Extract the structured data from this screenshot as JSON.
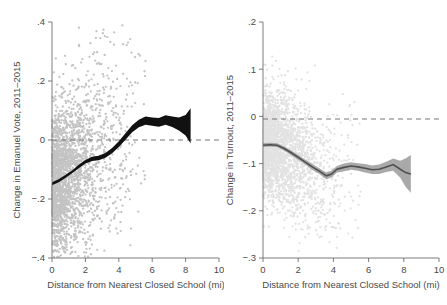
{
  "figure": {
    "width": 447,
    "height": 305,
    "background": "#ffffff"
  },
  "chart_data": [
    {
      "id": "left",
      "type": "scatter",
      "title": "",
      "xlabel": "Distance from Nearest Closed School (mi)",
      "ylabel": "Change in Emanuel Vote, 2011–2015",
      "xlim": [
        0,
        10
      ],
      "ylim": [
        -0.4,
        0.4
      ],
      "xticks": [
        0,
        2,
        4,
        6,
        8,
        10
      ],
      "xticklabels": [
        "0",
        "2",
        "4",
        "6",
        "8",
        "10"
      ],
      "yticks": [
        0.4,
        0.2,
        0,
        -0.2,
        -0.4
      ],
      "yticklabels": [
        ".4",
        ".2",
        "0",
        "-.2",
        "-.4"
      ],
      "grid": false,
      "legend": "none",
      "annotations": [
        {
          "kind": "hline",
          "y": 0,
          "style": "dashed",
          "color": "#777777"
        }
      ],
      "series": [
        {
          "name": "precinct observations",
          "type": "scatter",
          "color": "#c3c3c3",
          "marker": "circle",
          "n_points": 2400,
          "x_range": [
            0,
            6.6
          ],
          "y_range": [
            -0.4,
            0.4
          ],
          "density_note": "dense cloud concentrated between 0 and 2.5 mi, thinning outward"
        },
        {
          "name": "local polynomial fit with 95% CI",
          "type": "line-band",
          "color": "#111111",
          "x": [
            0.0,
            0.4,
            0.8,
            1.2,
            1.6,
            2.0,
            2.4,
            2.8,
            3.2,
            3.6,
            4.0,
            4.4,
            4.8,
            5.2,
            5.6,
            6.0,
            6.4,
            6.8,
            7.2,
            7.6,
            8.0,
            8.3
          ],
          "y": [
            -0.148,
            -0.138,
            -0.124,
            -0.108,
            -0.09,
            -0.074,
            -0.064,
            -0.061,
            -0.052,
            -0.036,
            -0.014,
            0.012,
            0.038,
            0.056,
            0.066,
            0.062,
            0.06,
            0.068,
            0.062,
            0.054,
            0.05,
            0.048
          ],
          "ci_halfwidth": [
            0.005,
            0.005,
            0.005,
            0.005,
            0.006,
            0.006,
            0.007,
            0.008,
            0.008,
            0.009,
            0.01,
            0.011,
            0.012,
            0.013,
            0.014,
            0.014,
            0.015,
            0.016,
            0.018,
            0.022,
            0.035,
            0.06
          ]
        }
      ]
    },
    {
      "id": "right",
      "type": "scatter",
      "title": "",
      "xlabel": "Distance from Nearest Closed School (mi)",
      "ylabel": "Change in Turnout, 2011–2015",
      "xlim": [
        0,
        10
      ],
      "ylim": [
        -0.3,
        0.2
      ],
      "xticks": [
        0,
        2,
        4,
        6,
        8,
        10
      ],
      "xticklabels": [
        "0",
        "2",
        "4",
        "6",
        "8",
        "10"
      ],
      "yticks": [
        0.2,
        0.1,
        0,
        -0.1,
        -0.2,
        -0.3
      ],
      "yticklabels": [
        ".2",
        ".1",
        "0",
        "-.1",
        "-.2",
        "-.3"
      ],
      "grid": false,
      "legend": "none",
      "annotations": [
        {
          "kind": "hline",
          "y": 0,
          "style": "dashed",
          "color": "#777777"
        }
      ],
      "series": [
        {
          "name": "precinct observations",
          "type": "scatter",
          "color": "#e2e2e2",
          "marker": "circle",
          "n_points": 2400,
          "x_range": [
            0,
            6.6
          ],
          "y_range": [
            -0.3,
            0.13
          ],
          "density_note": "very light grey cloud, densest near 0-2 mi"
        },
        {
          "name": "local polynomial fit with 95% CI",
          "type": "line-band",
          "color": "#4f4f4f",
          "x": [
            0.0,
            0.4,
            0.8,
            1.2,
            1.6,
            2.0,
            2.4,
            2.8,
            3.2,
            3.6,
            3.9,
            4.2,
            4.6,
            5.0,
            5.4,
            5.8,
            6.2,
            6.6,
            7.0,
            7.4,
            7.8,
            8.1,
            8.4
          ],
          "y": [
            -0.061,
            -0.06,
            -0.061,
            -0.068,
            -0.077,
            -0.087,
            -0.097,
            -0.107,
            -0.116,
            -0.126,
            -0.122,
            -0.112,
            -0.108,
            -0.105,
            -0.107,
            -0.11,
            -0.113,
            -0.112,
            -0.107,
            -0.102,
            -0.112,
            -0.119,
            -0.122
          ],
          "ci_halfwidth": [
            0.004,
            0.004,
            0.004,
            0.004,
            0.005,
            0.005,
            0.005,
            0.006,
            0.006,
            0.007,
            0.007,
            0.007,
            0.008,
            0.008,
            0.008,
            0.009,
            0.009,
            0.01,
            0.011,
            0.013,
            0.018,
            0.03,
            0.04
          ]
        }
      ]
    }
  ]
}
